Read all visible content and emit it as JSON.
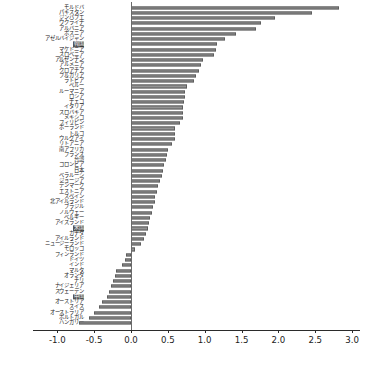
{
  "chart_data": {
    "type": "bar",
    "orientation": "horizontal",
    "title": "",
    "xlabel": "",
    "ylabel": "",
    "xlim": [
      -1.0,
      3.0
    ],
    "grid": false,
    "legend": null,
    "xticks": [
      "-1.0",
      "-0.5",
      "0.0",
      "0.5",
      "1.0",
      "1.5",
      "2.0",
      "2.5",
      "3.0"
    ],
    "xtick_values": [
      -1.0,
      -0.5,
      0.0,
      0.5,
      1.0,
      1.5,
      2.0,
      2.5,
      3.0
    ],
    "bar_color": "#939393",
    "bar_edge_color": "#5e5e5e",
    "highlight_color": "#555555",
    "highlight_text_color": "#ffffff",
    "highlighted_categories": [
      "韓国",
      "米国",
      "中国"
    ],
    "categories": [
      "モルドバ",
      "パキスタン",
      "ジンバブエ",
      "ウクライナ",
      "アルバニア",
      "ボスニア",
      "アゼルバイジャン",
      "韓国",
      "マケドニア",
      "スロベニア",
      "アルゼンチン",
      "アルメニア",
      "クロアチア",
      "ブルガリア",
      "ラトビア",
      "ペルー",
      "ルーマニア",
      "ロシア",
      "チェコ",
      "イタリア",
      "スロバキア",
      "メキシコ",
      "フィリピン",
      "ポーランド",
      "トルコ",
      "ウルグアイ",
      "リトアニア",
      "南アフリカ",
      "フランス",
      "台湾",
      "コロンビア",
      "日本",
      "ベラルーシ",
      "ジョージア",
      "デンマーク",
      "エストニア",
      "スペイン",
      "北アイルランド",
      "ブラジル",
      "ノルウェー",
      "ベルギー",
      "アイスランド",
      "米国",
      "カナダ",
      "アイルランド",
      "ニュージーランド",
      "モロッコ",
      "フィンランド",
      "ドイツ",
      "インド",
      "マルタ",
      "オランダ",
      "チリ",
      "ナイジェリア",
      "スウェーデン",
      "中国",
      "オーストリア",
      "スイス",
      "オーストラリア",
      "ポルトガル",
      "ハンガリー"
    ],
    "values": [
      2.82,
      2.45,
      1.95,
      1.77,
      1.69,
      1.42,
      1.27,
      1.17,
      1.16,
      1.13,
      0.98,
      0.95,
      0.92,
      0.88,
      0.85,
      0.76,
      0.73,
      0.73,
      0.72,
      0.71,
      0.7,
      0.7,
      0.66,
      0.6,
      0.6,
      0.6,
      0.56,
      0.5,
      0.49,
      0.47,
      0.45,
      0.43,
      0.42,
      0.4,
      0.37,
      0.35,
      0.33,
      0.32,
      0.3,
      0.28,
      0.26,
      0.24,
      0.23,
      0.2,
      0.17,
      0.13,
      0.05,
      -0.07,
      -0.08,
      -0.12,
      -0.2,
      -0.22,
      -0.25,
      -0.27,
      -0.3,
      -0.33,
      -0.39,
      -0.43,
      -0.5,
      -0.57,
      -0.7
    ]
  }
}
